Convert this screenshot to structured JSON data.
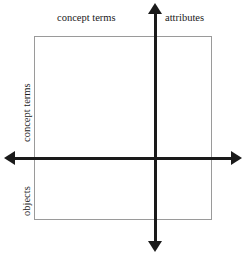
{
  "diagram": {
    "background_color": "#ffffff",
    "axis_color": "#1a1a1a",
    "box_border_color": "#9a9a9a",
    "labels": {
      "top_left_region": "concept terms",
      "top_right_region": "attributes",
      "left_upper_region": "concept terms",
      "left_lower_region": "objects"
    },
    "axes": {
      "vertical": {
        "name": "vertical-axis",
        "arrow_up": "arrow-up",
        "arrow_down": "arrow-down"
      },
      "horizontal": {
        "name": "horizontal-axis",
        "arrow_left": "arrow-left",
        "arrow_right": "arrow-right"
      }
    },
    "box": {
      "name": "context-box"
    }
  }
}
